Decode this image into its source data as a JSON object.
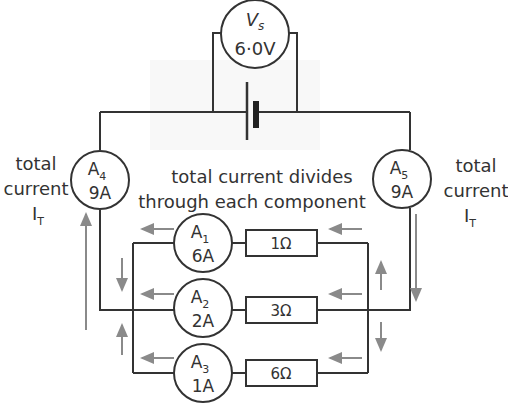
{
  "voltmeter": {
    "name": "V",
    "sub": "s",
    "value": "6·0V"
  },
  "left_label": {
    "line1": "total",
    "line2": "current",
    "symbol": "I",
    "sub": "T"
  },
  "right_label": {
    "line1": "total",
    "line2": "current",
    "symbol": "I",
    "sub": "T"
  },
  "caption": {
    "line1": "total current divides",
    "line2": "through each component"
  },
  "ammeters": {
    "a4": {
      "name": "A",
      "sub": "4",
      "value": "9A"
    },
    "a5": {
      "name": "A",
      "sub": "5",
      "value": "9A"
    },
    "a1": {
      "name": "A",
      "sub": "1",
      "value": "6A"
    },
    "a2": {
      "name": "A",
      "sub": "2",
      "value": "2A"
    },
    "a3": {
      "name": "A",
      "sub": "3",
      "value": "1A"
    }
  },
  "resistors": {
    "r1": "1Ω",
    "r2": "3Ω",
    "r3": "6Ω"
  },
  "colors": {
    "wire": "#333333",
    "arrow": "#8a8a8a"
  }
}
